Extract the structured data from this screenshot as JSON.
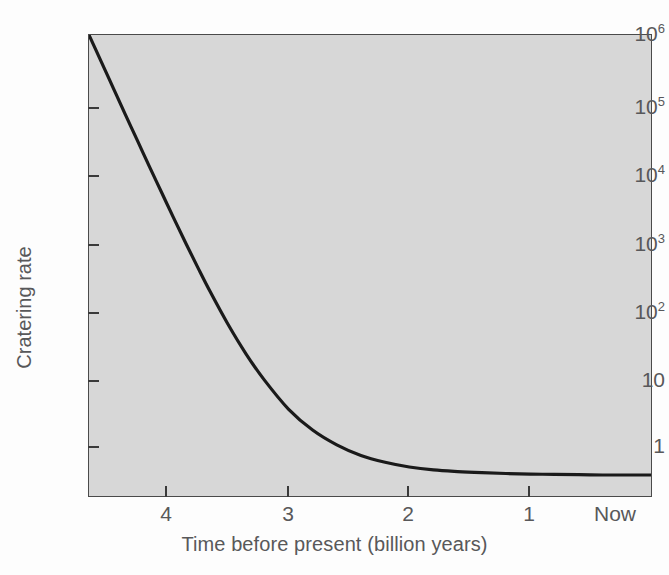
{
  "chart_data": {
    "type": "line",
    "title": "",
    "xlabel": "Time before present (billion years)",
    "ylabel": "Cratering rate",
    "yscale": "log",
    "xscale": "linear",
    "xlim": [
      4.65,
      0
    ],
    "ylim": [
      0.25,
      1000000
    ],
    "grid": false,
    "legend": null,
    "x_ticks": [
      {
        "value": 4,
        "label": "4"
      },
      {
        "value": 3,
        "label": "3"
      },
      {
        "value": 2,
        "label": "2"
      },
      {
        "value": 1,
        "label": "1"
      },
      {
        "value": 0,
        "label": "Now"
      }
    ],
    "y_ticks": [
      {
        "value": 1000000,
        "mantissa": "10",
        "exponent": "6"
      },
      {
        "value": 100000,
        "mantissa": "10",
        "exponent": "5"
      },
      {
        "value": 10000,
        "mantissa": "10",
        "exponent": "4"
      },
      {
        "value": 1000,
        "mantissa": "10",
        "exponent": "3"
      },
      {
        "value": 100,
        "mantissa": "10",
        "exponent": "2"
      },
      {
        "value": 10,
        "mantissa": "10",
        "exponent": ""
      },
      {
        "value": 1,
        "mantissa": "1",
        "exponent": ""
      }
    ],
    "series": [
      {
        "name": "Cratering rate",
        "color": "#1a1a1a",
        "x": [
          4.65,
          4.55,
          4.45,
          4.35,
          4.25,
          4.15,
          4.05,
          3.95,
          3.85,
          3.75,
          3.65,
          3.5,
          3.35,
          3.2,
          3.0,
          2.8,
          2.6,
          2.4,
          2.2,
          2.0,
          1.8,
          1.6,
          1.4,
          1.2,
          1.0,
          0.8,
          0.6,
          0.4,
          0.2,
          0.0
        ],
        "y": [
          1000000,
          420000,
          175000,
          73000,
          31000,
          13000,
          5600,
          2400,
          1050,
          470,
          215,
          72,
          27,
          11.5,
          4.4,
          2.2,
          1.35,
          0.95,
          0.76,
          0.65,
          0.59,
          0.56,
          0.54,
          0.525,
          0.515,
          0.51,
          0.505,
          0.5,
          0.5,
          0.5
        ]
      }
    ],
    "annotations": []
  },
  "colors": {
    "plot_background": "#d7d7d7",
    "figure_background": "#fdfdfd",
    "axis_line": "#4a4a4a",
    "curve": "#1a1a1a",
    "label_text": "#58585a"
  }
}
